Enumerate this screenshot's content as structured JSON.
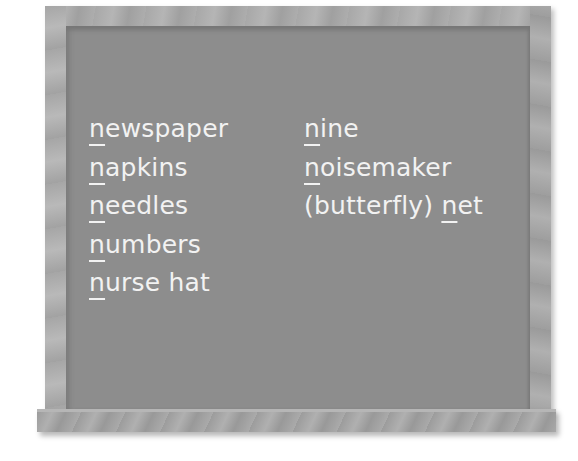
{
  "board": {
    "colors": {
      "chalkboard": "#8d8d8d",
      "frame": "#a8a8a8",
      "chalk": "#f2f2f2"
    },
    "left_column": [
      {
        "initial": "n",
        "rest": "ewspaper",
        "prefix": ""
      },
      {
        "initial": "n",
        "rest": "apkins",
        "prefix": ""
      },
      {
        "initial": "n",
        "rest": "eedles",
        "prefix": ""
      },
      {
        "initial": "n",
        "rest": "umbers",
        "prefix": ""
      },
      {
        "initial": "n",
        "rest": "urse hat",
        "prefix": ""
      }
    ],
    "right_column": [
      {
        "initial": "n",
        "rest": "ine",
        "prefix": ""
      },
      {
        "initial": "n",
        "rest": "oisemaker",
        "prefix": ""
      },
      {
        "initial": "n",
        "rest": "et",
        "prefix": "(butterfly) "
      }
    ]
  }
}
